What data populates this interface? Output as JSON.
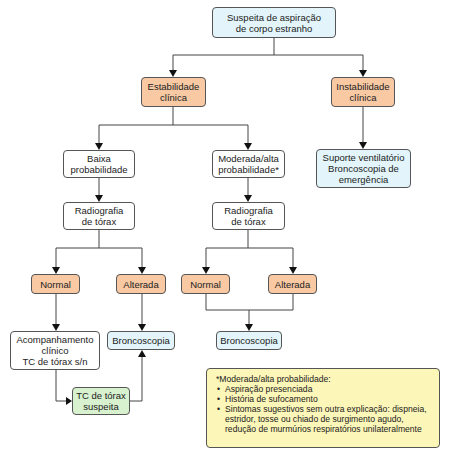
{
  "flowchart": {
    "root": {
      "line1": "Suspeita de aspiração",
      "line2": "de corpo estranho"
    },
    "stable": {
      "line1": "Estabilidade",
      "line2": "clínica"
    },
    "unstable": {
      "line1": "Instabilidade",
      "line2": "clínica"
    },
    "unstable_action": {
      "line1": "Suporte ventilatório",
      "line2": "Broncoscopia de",
      "line3": "emergência"
    },
    "low_prob": {
      "line1": "Baixa",
      "line2": "probabilidade"
    },
    "high_prob": {
      "line1": "Moderada/alta",
      "line2": "probabilidade*"
    },
    "xray_left": {
      "line1": "Radiografia",
      "line2": "de tórax"
    },
    "xray_right": {
      "line1": "Radiografia",
      "line2": "de tórax"
    },
    "normal_left": {
      "label": "Normal"
    },
    "altered_left": {
      "label": "Alterada"
    },
    "normal_right": {
      "label": "Normal"
    },
    "altered_right": {
      "label": "Alterada"
    },
    "followup": {
      "line1": "Acompanhamento",
      "line2": "clínico",
      "line3": "TC de tórax s/n"
    },
    "bronch_left": {
      "label": "Broncoscopia"
    },
    "ct_suspect": {
      "line1": "TC de tórax",
      "line2": "suspeita"
    },
    "bronch_right": {
      "label": "Broncoscopia"
    }
  },
  "note": {
    "title": "*Moderada/alta probabilidade:",
    "items": [
      "Aspiração presenciada",
      "História de sufocamento",
      "Sintomas sugestivos sem outra explicação: dispneia, estridor, tosse ou chiado de surgimento agudo, redução de murmúrios respiratórios unilateralmente"
    ]
  },
  "colors": {
    "blue_node": "#e3f5fa",
    "orange_node": "#f8c9a3",
    "green_node": "#d8f1cf",
    "note_bg": "#fcf6b8"
  }
}
